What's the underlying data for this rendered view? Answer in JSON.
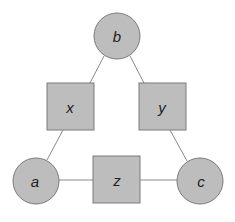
{
  "diagram": {
    "colors": {
      "node_fill": "#bdbdbd",
      "node_stroke": "#7a7a7a",
      "edge": "#8a8a8a",
      "label": "#222222"
    },
    "nodes": [
      {
        "id": "b",
        "shape": "circle",
        "label": "b"
      },
      {
        "id": "x",
        "shape": "square",
        "label": "x"
      },
      {
        "id": "y",
        "shape": "square",
        "label": "y"
      },
      {
        "id": "a",
        "shape": "circle",
        "label": "a"
      },
      {
        "id": "z",
        "shape": "square",
        "label": "z"
      },
      {
        "id": "c",
        "shape": "circle",
        "label": "c"
      }
    ],
    "edges": [
      {
        "from": "b",
        "to": "x"
      },
      {
        "from": "b",
        "to": "y"
      },
      {
        "from": "x",
        "to": "a"
      },
      {
        "from": "y",
        "to": "c"
      },
      {
        "from": "a",
        "to": "z"
      },
      {
        "from": "z",
        "to": "c"
      }
    ]
  }
}
